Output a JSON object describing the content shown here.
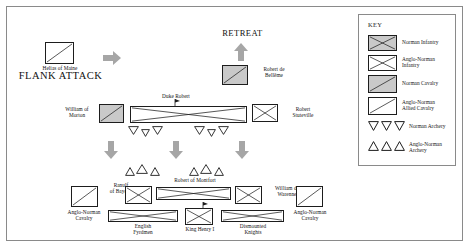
{
  "diagram": {
    "title_top_right": "RETREAT",
    "title_left": "FLANK ATTACK"
  },
  "labels": {
    "helias": "Helias of Maine",
    "robert_belleme": "Robert de\nBellême",
    "william_morton": "William of\nMorton",
    "duke_robert": "Duke Robert",
    "robert_stuteville": "Robert\nStuteville",
    "ranulf_bayeux": "Ranulf\nof Bayeux",
    "robert_montfort": "Robert of Montfort",
    "william_warenne": "William de\nWarenne",
    "anglo_norman_cavalry_left": "Anglo-Norman\nCavalry",
    "anglo_norman_cavalry_right": "Anglo-Norman\nCavalry",
    "english_fyrdmen": "English\nFyrdmen",
    "king_henry": "King Henry I",
    "dismounted_knights": "Dismounted\nKnights"
  },
  "key": {
    "title": "KEY",
    "entries": [
      {
        "label": "Norman Infantry",
        "symbol": "box-gray-x",
        "icon_name": "norman-infantry-symbol"
      },
      {
        "label": "Anglo-Norman\nInfantry",
        "symbol": "box-white-x",
        "icon_name": "anglo-norman-infantry-symbol"
      },
      {
        "label": "Norman Cavalry",
        "symbol": "box-gray-diag",
        "icon_name": "norman-cavalry-symbol"
      },
      {
        "label": "Anglo-Norman\nAllied Cavalry",
        "symbol": "box-white-diag",
        "icon_name": "anglo-norman-allied-cavalry-symbol"
      },
      {
        "label": "Norman Archery",
        "symbol": "triangles-down",
        "icon_name": "norman-archery-symbol"
      },
      {
        "label": "Anglo-Norman\nArchery",
        "symbol": "triangles-up",
        "icon_name": "anglo-norman-archery-symbol"
      }
    ]
  },
  "colors": {
    "norman_fill": "#c9c9c9",
    "anglo_fill": "#ffffff",
    "outline": "#1d1d1d",
    "arrow_gray": "#a6a6a6",
    "frame": "#8a8a8a"
  },
  "counts": {
    "norman_archery_groups": 2,
    "norman_archery_per_group": 3,
    "anglo_archery_groups": 2,
    "anglo_archery_per_group": 3,
    "movement_arrows_down": 3,
    "flank_arrows_right": 1,
    "retreat_arrows_up": 1
  }
}
